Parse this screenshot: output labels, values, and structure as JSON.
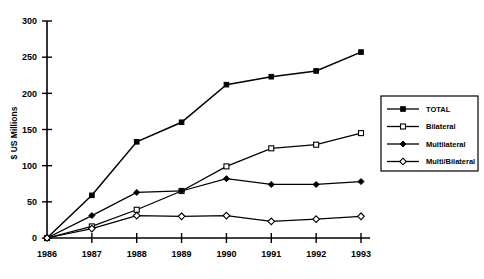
{
  "chart_data": {
    "type": "line",
    "title": "",
    "subtitle": "",
    "xlabel": "",
    "ylabel": "$ US Millions",
    "categories": [
      "1986",
      "1987",
      "1988",
      "1989",
      "1990",
      "1991",
      "1992",
      "1993"
    ],
    "x": [
      1986,
      1987,
      1988,
      1989,
      1990,
      1991,
      1992,
      1993
    ],
    "ylim": [
      0,
      300
    ],
    "yticks": [
      0,
      50,
      100,
      150,
      200,
      250,
      300
    ],
    "ytick_labels": [
      "0",
      "50",
      "100",
      "150",
      "200",
      "250",
      "300"
    ],
    "grid": false,
    "legend_position": "right-center",
    "series": [
      {
        "name": "TOTAL",
        "marker": "filled-square",
        "values": [
          0,
          59,
          133,
          160,
          212,
          223,
          231,
          257
        ]
      },
      {
        "name": "Bilateral",
        "marker": "open-square",
        "values": [
          0,
          16,
          39,
          65,
          99,
          124,
          129,
          145
        ]
      },
      {
        "name": "Multilateral",
        "marker": "filled-diamond",
        "values": [
          0,
          31,
          63,
          65,
          82,
          74,
          74,
          78
        ]
      },
      {
        "name": "Multi/Bilateral",
        "marker": "open-diamond",
        "values": [
          0,
          13,
          31,
          30,
          31,
          23,
          26,
          30
        ]
      }
    ]
  },
  "legend": {
    "entries": [
      {
        "label": "TOTAL"
      },
      {
        "label": "Bilateral"
      },
      {
        "label": "Multilateral"
      },
      {
        "label": "Multi/Bilateral"
      }
    ]
  },
  "colors": {
    "ink": "#000000",
    "background": "#ffffff"
  }
}
